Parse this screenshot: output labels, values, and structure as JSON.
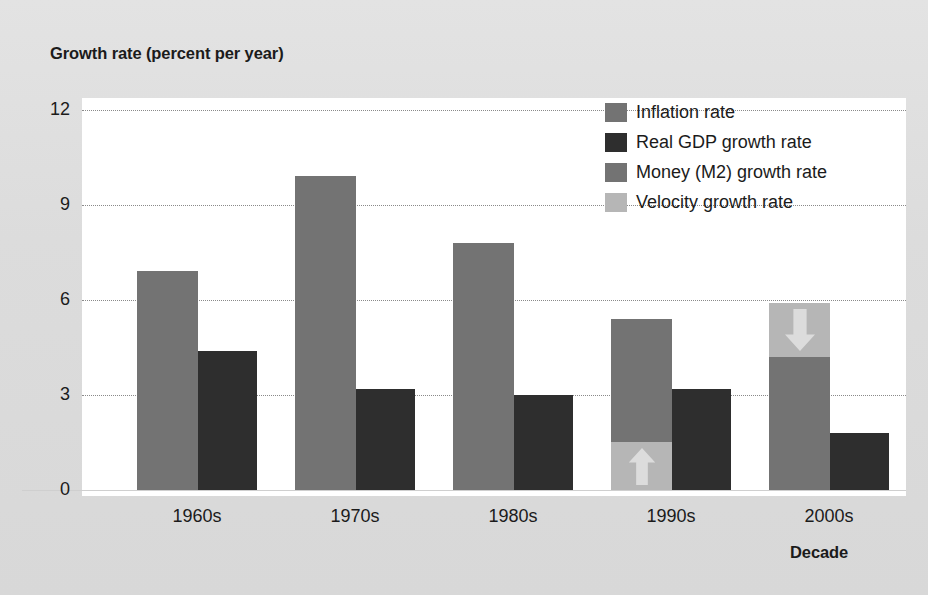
{
  "figure": {
    "y_axis_title": "Growth rate (percent per year)",
    "x_axis_title": "Decade"
  },
  "legend": {
    "items": [
      {
        "label": "Inflation rate",
        "color": "#737373",
        "key": "inflation"
      },
      {
        "label": "Real GDP growth rate",
        "color": "#2e2e2e",
        "key": "gdp"
      },
      {
        "label": "Money (M2) growth rate",
        "color": "#737373",
        "key": "money"
      },
      {
        "label": "Velocity growth rate",
        "color": "#b6b6b6",
        "key": "velocity"
      }
    ]
  },
  "axes": {
    "y_ticks": [
      "0",
      "3",
      "6",
      "9",
      "12"
    ],
    "x_ticks": [
      "1960s",
      "1970s",
      "1980s",
      "1990s",
      "2000s"
    ]
  },
  "chart_data": {
    "type": "bar",
    "title": "",
    "xlabel": "Decade",
    "ylabel": "Growth rate (percent per year)",
    "ylim": [
      0,
      12
    ],
    "yticks": [
      0,
      3,
      6,
      9,
      12
    ],
    "grid": "horizontal-dotted",
    "legend_position": "inside-top-right",
    "categories": [
      "1960s",
      "1970s",
      "1980s",
      "1990s",
      "2000s"
    ],
    "series": [
      {
        "name": "Inflation rate",
        "values": [
          6.9,
          9.9,
          7.8,
          null,
          null
        ]
      },
      {
        "name": "Real GDP growth rate",
        "values": [
          4.4,
          3.2,
          3.0,
          3.2,
          1.8
        ]
      },
      {
        "name": "Money (M2) growth rate",
        "values": [
          null,
          null,
          null,
          5.4,
          4.2
        ]
      },
      {
        "name": "Velocity growth rate",
        "values": [
          null,
          null,
          null,
          1.5,
          -1.8
        ]
      }
    ],
    "notes": [
      "1990s and 2000s left bar is stacked: Money (M2) growth rate with a Velocity growth rate portion.",
      "1990s velocity portion 0 to 1.5 with an upward arrow (velocity rising).",
      "2000s velocity portion 4.2 to 5.9 with a downward arrow (velocity falling)."
    ]
  },
  "bars": {
    "groups": [
      {
        "decade": "1960s",
        "left_x": 115,
        "bar_width": 61,
        "segments": [
          {
            "kind": "inflation",
            "from": 0,
            "to": 6.9
          }
        ],
        "right_bar": {
          "kind": "gdp",
          "from": 0,
          "to": 4.4,
          "width": 59
        }
      },
      {
        "decade": "1970s",
        "left_x": 273,
        "bar_width": 61,
        "segments": [
          {
            "kind": "inflation",
            "from": 0,
            "to": 9.9
          }
        ],
        "right_bar": {
          "kind": "gdp",
          "from": 0,
          "to": 3.2,
          "width": 59
        }
      },
      {
        "decade": "1980s",
        "left_x": 431,
        "bar_width": 61,
        "segments": [
          {
            "kind": "inflation",
            "from": 0,
            "to": 7.8
          }
        ],
        "right_bar": {
          "kind": "gdp",
          "from": 0,
          "to": 3.0,
          "width": 59
        }
      },
      {
        "decade": "1990s",
        "left_x": 589,
        "bar_width": 61,
        "segments": [
          {
            "kind": "velocity",
            "from": 0,
            "to": 1.5,
            "arrow": "up"
          },
          {
            "kind": "money",
            "from": 1.5,
            "to": 5.4
          }
        ],
        "right_bar": {
          "kind": "gdp",
          "from": 0,
          "to": 3.2,
          "width": 59
        }
      },
      {
        "decade": "2000s",
        "left_x": 747,
        "bar_width": 61,
        "segments": [
          {
            "kind": "money",
            "from": 0,
            "to": 4.2
          },
          {
            "kind": "velocity",
            "from": 4.2,
            "to": 5.9,
            "arrow": "down"
          }
        ],
        "right_bar": {
          "kind": "gdp",
          "from": 0,
          "to": 1.8,
          "width": 59
        }
      }
    ]
  }
}
